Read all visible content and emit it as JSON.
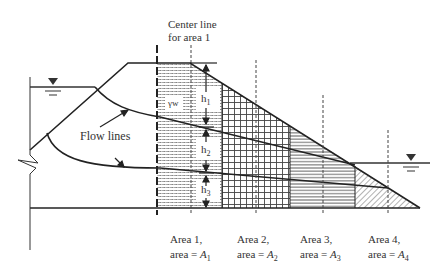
{
  "figure": {
    "center_line_label": [
      "Center line",
      "for area 1"
    ],
    "flow_lines_label": "Flow lines",
    "gamma_w_label": "γw",
    "heights": [
      "h1",
      "h2",
      "h3"
    ],
    "areas": [
      {
        "line1": "Area 1,",
        "line2_prefix": "area = ",
        "symbol": "A",
        "sub": "1"
      },
      {
        "line1": "Area 2,",
        "line2_prefix": "area = ",
        "symbol": "A",
        "sub": "2"
      },
      {
        "line1": "Area 3,",
        "line2_prefix": "area = ",
        "symbol": "A",
        "sub": "3"
      },
      {
        "line1": "Area 4,",
        "line2_prefix": "area = ",
        "symbol": "A",
        "sub": "4"
      }
    ],
    "water_level_symbols": [
      "upstream-water-level",
      "downstream-water-level"
    ],
    "colors": {
      "line": "#222222",
      "hatch": "#555555",
      "background": "#ffffff"
    }
  }
}
